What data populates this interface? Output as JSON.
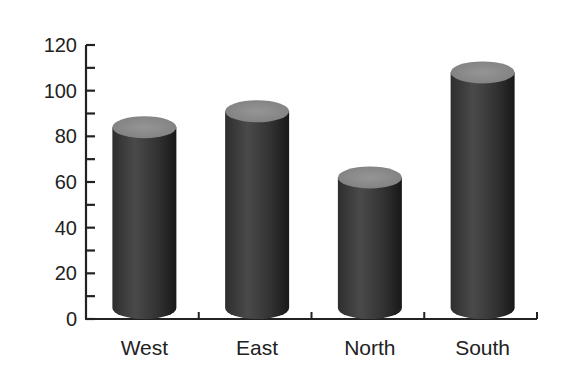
{
  "chart_data": {
    "type": "bar",
    "style": "3d-cylinder",
    "title": "",
    "xlabel": "",
    "ylabel": "",
    "categories": [
      "West",
      "East",
      "North",
      "South"
    ],
    "values": [
      84,
      91,
      62,
      108
    ],
    "ylim": [
      0,
      120
    ],
    "yticks": [
      0,
      20,
      40,
      60,
      80,
      100,
      120
    ],
    "ytick_labels": [
      "0",
      "20",
      "40",
      "60",
      "80",
      "100",
      "120"
    ],
    "minor_ytick_step": 10,
    "grid": false,
    "legend": null,
    "colors": {
      "body_dark": "#1c1c1c",
      "body_mid": "#4a4a4a",
      "top": "#8c8c8c",
      "axis": "#222222"
    }
  }
}
